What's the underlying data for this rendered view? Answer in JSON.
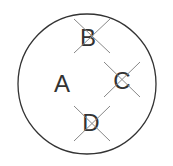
{
  "diagram": {
    "circle": {
      "cx": 86,
      "cy": 84,
      "rx": 70,
      "ry": 70,
      "stroke": "#333333"
    },
    "labels": [
      {
        "id": "A",
        "text": "A",
        "x": 62,
        "y": 92,
        "crossed": false
      },
      {
        "id": "B",
        "text": "B",
        "x": 88,
        "y": 44,
        "crossed": true
      },
      {
        "id": "C",
        "text": "C",
        "x": 121,
        "y": 88,
        "crossed": true
      },
      {
        "id": "D",
        "text": "D",
        "x": 92,
        "y": 132,
        "crossed": true
      }
    ],
    "cross_color": "#888888"
  }
}
